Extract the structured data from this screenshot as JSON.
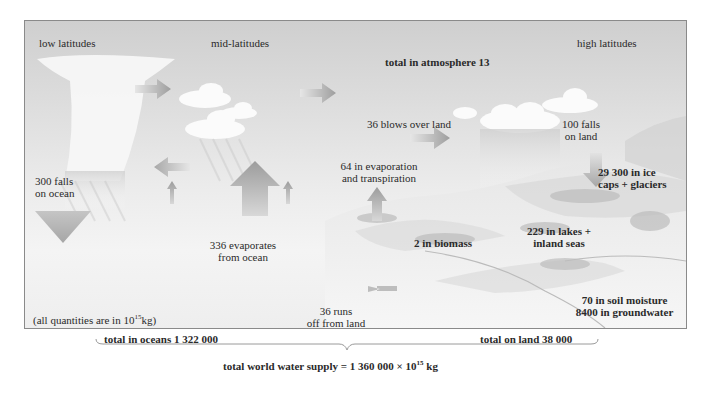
{
  "diagram": {
    "regions": {
      "low": "low latitudes",
      "mid": "mid-latitudes",
      "high": "high latitudes"
    },
    "atmosphere_total": "total in atmosphere 13",
    "flows": {
      "falls_on_ocean_1": "300 falls",
      "falls_on_ocean_2": "on ocean",
      "evaporates_ocean_1": "336 evaporates",
      "evaporates_ocean_2": "from ocean",
      "blows_over_land": "36 blows over land",
      "falls_on_land_1": "100 falls",
      "falls_on_land_2": "on land",
      "evapotranspiration_1": "64 in evaporation",
      "evapotranspiration_2": "and transpiration",
      "runoff_1": "36 runs",
      "runoff_2": "off from land"
    },
    "stores": {
      "ice_1": "29 300 in ice",
      "ice_2": "caps + glaciers",
      "biomass": "2 in biomass",
      "lakes_1": "229 in lakes +",
      "lakes_2": "inland seas",
      "soil": "70 in soil moisture",
      "groundwater": "8400 in groundwater"
    },
    "units_note_prefix": "(all quantities are in 10",
    "units_note_exp": "15",
    "units_note_suffix": "kg)",
    "totals": {
      "oceans": "total in oceans 1 322 000",
      "land": "total on land 38 000",
      "world_prefix": "total world water supply = 1 360 000 × 10",
      "world_exp": "15",
      "world_suffix": " kg"
    },
    "colors": {
      "frame_border": "#8a8a8a",
      "arrow": "#a8a8a8",
      "cloud": "#fafafa",
      "text": "#2a2a2a"
    }
  }
}
